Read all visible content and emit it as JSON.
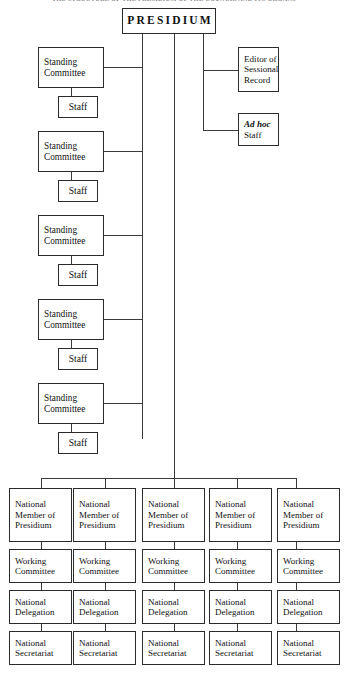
{
  "page": {
    "heading": "THE STRUCTURE OF THE PRESIDIUM OF THE COUNCIL AND ITS ORGANS",
    "background_color": "#ffffff",
    "line_color": "#3a3a3a",
    "border_color": "#2b2b2b",
    "text_color": "#111111"
  },
  "root": {
    "label": "PRESIDIUM"
  },
  "left_branch": {
    "committee_label_line1": "Standing",
    "committee_label_line2": "Committee",
    "staff_label": "Staff",
    "committees": [
      {
        "line1": "Standing",
        "line2": "Committee",
        "staff": "Staff"
      },
      {
        "line1": "Standing",
        "line2": "Committee",
        "staff": "Staff"
      },
      {
        "line1": "Standing",
        "line2": "Committee",
        "staff": "Staff"
      },
      {
        "line1": "Standing",
        "line2": "Committee",
        "staff": "Staff"
      },
      {
        "line1": "Standing",
        "line2": "Committee",
        "staff": "Staff"
      }
    ]
  },
  "right_branch": {
    "editor": {
      "line1": "Editor of",
      "line2": "Sessional",
      "line3": "Record"
    },
    "ad_hoc": {
      "line1": "Ad hoc",
      "line2": "Staff"
    }
  },
  "bottom_grid": {
    "row_labels": {
      "member": {
        "line1": "National",
        "line2": "Member of",
        "line3": "Presidium"
      },
      "working": {
        "line1": "Working",
        "line2": "Committee"
      },
      "delegation": {
        "line1": "National",
        "line2": "Delegation"
      },
      "secretariat": {
        "line1": "National",
        "line2": "Secretariat"
      }
    },
    "columns": [
      {
        "member_l1": "National",
        "member_l2": "Member of",
        "member_l3": "Presidium",
        "working_l1": "Working",
        "working_l2": "Committee",
        "delegation_l1": "National",
        "delegation_l2": "Delegation",
        "secretariat_l1": "National",
        "secretariat_l2": "Secretariat"
      },
      {
        "member_l1": "National",
        "member_l2": "Member of",
        "member_l3": "Presidium",
        "working_l1": "Working",
        "working_l2": "Committee",
        "delegation_l1": "National",
        "delegation_l2": "Delegation",
        "secretariat_l1": "National",
        "secretariat_l2": "Secretariat"
      },
      {
        "member_l1": "National",
        "member_l2": "Member of",
        "member_l3": "Presidium",
        "working_l1": "Working",
        "working_l2": "Committee",
        "delegation_l1": "National",
        "delegation_l2": "Delegation",
        "secretariat_l1": "National",
        "secretariat_l2": "Secretariat"
      },
      {
        "member_l1": "National",
        "member_l2": "Member of",
        "member_l3": "Presidium",
        "working_l1": "Working",
        "working_l2": "Committee",
        "delegation_l1": "National",
        "delegation_l2": "Delegation",
        "secretariat_l1": "National",
        "secretariat_l2": "Secretariat"
      },
      {
        "member_l1": "National",
        "member_l2": "Member of",
        "member_l3": "Presidium",
        "working_l1": "Working",
        "working_l2": "Committee",
        "delegation_l1": "National",
        "delegation_l2": "Delegation",
        "secretariat_l1": "National",
        "secretariat_l2": "Secretariat"
      }
    ]
  }
}
